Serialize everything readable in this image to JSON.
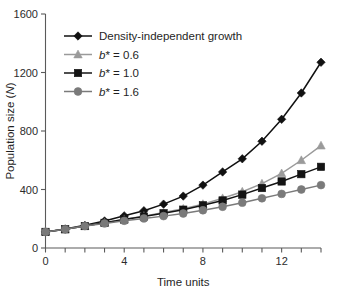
{
  "chart_data": {
    "type": "line",
    "title": "",
    "xlabel": "Time units",
    "ylabel": "Population size (N)",
    "ylabel_plain": "Population size",
    "ylabel_italic_symbol": "N",
    "xlim": [
      0,
      14
    ],
    "ylim": [
      0,
      1600
    ],
    "x_ticks_major": [
      0,
      4,
      8,
      12
    ],
    "x_tick_labels": [
      "0",
      "4",
      "8",
      "12"
    ],
    "x_ticks_all": [
      0,
      1,
      2,
      3,
      4,
      5,
      6,
      7,
      8,
      9,
      10,
      11,
      12,
      13,
      14
    ],
    "y_ticks": [
      0,
      400,
      800,
      1200,
      1600
    ],
    "y_tick_labels": [
      "0",
      "400",
      "800",
      "1200",
      "1600"
    ],
    "grid": false,
    "legend_position": "upper-left-inside",
    "x": [
      0,
      1,
      2,
      3,
      4,
      5,
      6,
      7,
      8,
      9,
      10,
      11,
      12,
      13,
      14
    ],
    "series": [
      {
        "name": "Density-independent growth",
        "marker": "diamond",
        "color": "#111111",
        "values": [
          110,
          130,
          155,
          185,
          220,
          255,
          300,
          355,
          430,
          520,
          610,
          730,
          880,
          1060,
          1270
        ]
      },
      {
        "name": "b* = 0.6",
        "label_prefix": "b",
        "label_star": "*",
        "label_suffix": " = 0.6",
        "marker": "triangle",
        "color": "#9a9a9a",
        "values": [
          110,
          128,
          150,
          172,
          196,
          218,
          243,
          268,
          300,
          340,
          385,
          440,
          510,
          600,
          700
        ]
      },
      {
        "name": "b* = 1.0",
        "label_prefix": "b",
        "label_star": "*",
        "label_suffix": " = 1.0",
        "marker": "square",
        "color": "#141414",
        "values": [
          110,
          128,
          150,
          172,
          195,
          215,
          238,
          262,
          292,
          325,
          365,
          410,
          455,
          505,
          555
        ]
      },
      {
        "name": "b* = 1.6",
        "label_prefix": "b",
        "label_star": "*",
        "label_suffix": " = 1.6",
        "marker": "circle",
        "color": "#7a7a7a",
        "values": [
          110,
          128,
          150,
          168,
          186,
          202,
          218,
          236,
          258,
          282,
          310,
          340,
          370,
          400,
          430
        ]
      }
    ]
  },
  "legend": {
    "entries": [
      {
        "label": "Density-independent growth",
        "italic_part": "",
        "star": "",
        "rest": ""
      },
      {
        "label": "b* = 0.6",
        "italic_part": "b",
        "star": "*",
        "rest": " = 0.6"
      },
      {
        "label": "b* = 1.0",
        "italic_part": "b",
        "star": "*",
        "rest": " = 1.0"
      },
      {
        "label": "b* = 1.6",
        "italic_part": "b",
        "star": "*",
        "rest": " = 1.6"
      }
    ]
  },
  "colors": {
    "series_black": "#111111",
    "series_light_gray": "#9a9a9a",
    "series_dark": "#141414",
    "series_mid_gray": "#7a7a7a",
    "axis": "#5a5a5a",
    "text": "#1f1f1f",
    "background": "#ffffff"
  }
}
